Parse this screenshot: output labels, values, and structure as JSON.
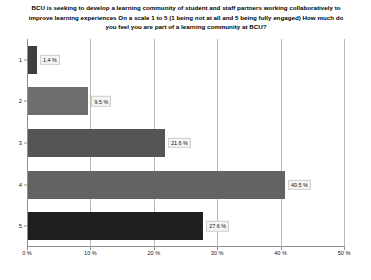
{
  "chart_data": {
    "type": "bar",
    "orientation": "horizontal",
    "title_lines": [
      "BCU is seeking to develop a learning community of student and staff partners working collaboratively to",
      "improve learning experiences  On a scale 1 to 5 (1 being not at all and 5 being fully engaged) How much do",
      "you feel you are part of a learning community at BCU?"
    ],
    "categories": [
      "1",
      "2",
      "3",
      "4",
      "5"
    ],
    "values": [
      1.4,
      9.5,
      21.6,
      40.5,
      27.6
    ],
    "data_labels": [
      "1.4 %",
      "9.5 %",
      "21.6 %",
      "40.5 %",
      "27.6 %"
    ],
    "bar_colors": [
      "#3f3f3f",
      "#6e6e6e",
      "#555555",
      "#636363",
      "#1f1f1f"
    ],
    "xlabel": "",
    "ylabel": "",
    "xlim": [
      0,
      50
    ],
    "ylim": [
      0,
      5
    ],
    "xticks": [
      0,
      10,
      20,
      30,
      40,
      50
    ],
    "xtick_labels": [
      "0 %",
      "10 %",
      "20 %",
      "30 %",
      "40 %",
      "50 %"
    ],
    "ytick_labels": [
      "1",
      "2",
      "3",
      "4",
      "5"
    ],
    "grid": true,
    "grid_axis": "x",
    "legend": false,
    "legend_position": "none",
    "units": "percent",
    "background_color": "#ffffff",
    "gridline_color": "#b9b9b9",
    "axis_color": "#8f8f8f"
  }
}
